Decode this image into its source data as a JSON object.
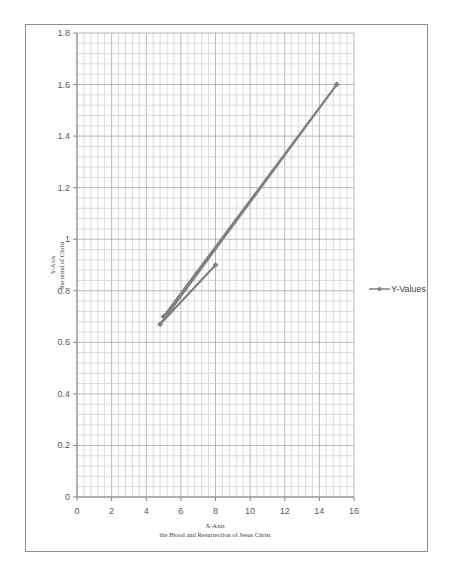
{
  "chart_data": {
    "type": "scatter",
    "title": "",
    "xlabel": "X-Axis",
    "xlabel_sub": "the Blood and Resurrection of Jesus Christ",
    "ylabel": "Y-Axis",
    "ylabel_sub": "the mind of Christ",
    "xlim": [
      0,
      16
    ],
    "ylim": [
      0,
      1.8
    ],
    "x_ticks": [
      0,
      2,
      4,
      6,
      8,
      10,
      12,
      14,
      16
    ],
    "y_ticks": [
      0,
      0.2,
      0.4,
      0.6,
      0.8,
      1,
      1.2,
      1.4,
      1.6,
      1.8
    ],
    "y_tick_labels": [
      "0",
      "0.2",
      "0.4",
      "0.6",
      "0.8",
      "1",
      "1.2",
      "1.4",
      "1.6",
      "1.8"
    ],
    "grid": true,
    "legend_position": "right",
    "series": [
      {
        "name": "Y-Values",
        "color": "#808080",
        "marker": "diamond",
        "points": [
          {
            "x": 5,
            "y": 0.7
          },
          {
            "x": 15,
            "y": 1.6
          },
          {
            "x": 4.8,
            "y": 0.67
          },
          {
            "x": 8,
            "y": 0.9
          }
        ]
      }
    ]
  },
  "legend": {
    "label": "Y-Values"
  },
  "axes": {
    "x_title": "X-Axis",
    "x_subtitle": "the Blood and Resurrection of Jesus Christ",
    "y_title": "Y-Axis",
    "y_subtitle": "the mind of Christ"
  }
}
